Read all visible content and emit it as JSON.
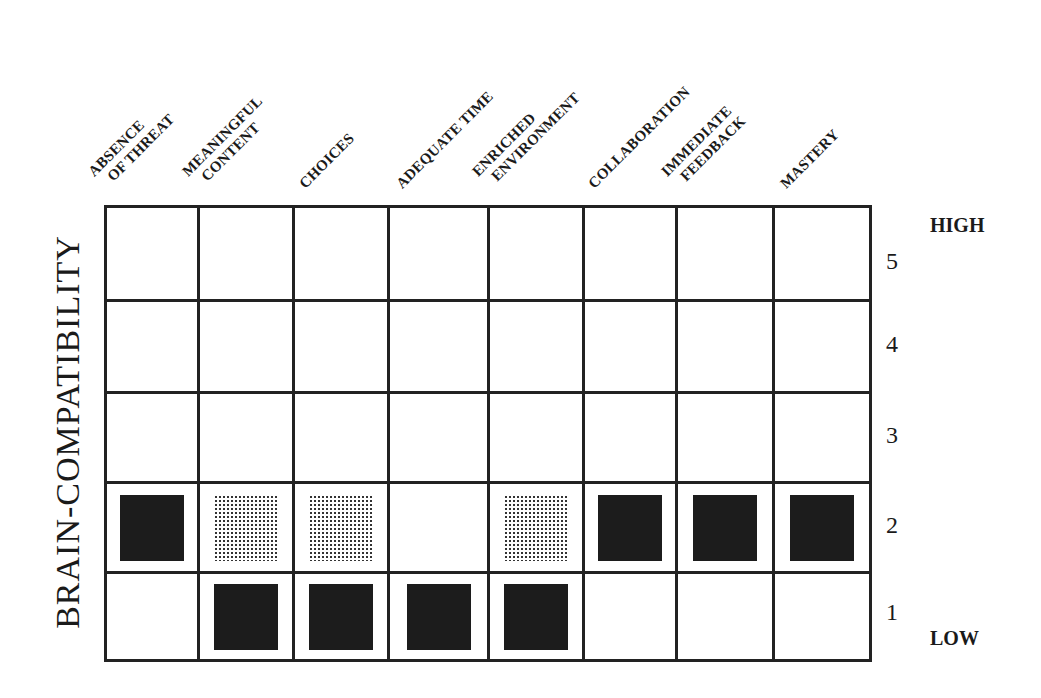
{
  "chart_data": {
    "type": "heatmap",
    "title": "",
    "ylabel": "BRAIN-COMPATIBILITY",
    "xlabel": "",
    "categories": [
      "ABSENCE OF THREAT",
      "MEANINGFUL CONTENT",
      "CHOICES",
      "ADEQUATE TIME",
      "ENRICHED ENVIRONMENT",
      "COLLABORATION",
      "IMMEDIATE FEEDBACK",
      "MASTERY"
    ],
    "category_label_lines": [
      [
        "ABSENCE",
        "OF THREAT"
      ],
      [
        "MEANINGFUL",
        "CONTENT"
      ],
      [
        "CHOICES"
      ],
      [
        "ADEQUATE TIME"
      ],
      [
        "ENRICHED",
        "ENVIRONMENT"
      ],
      [
        "COLLABORATION"
      ],
      [
        "IMMEDIATE",
        "FEEDBACK"
      ],
      [
        "MASTERY"
      ]
    ],
    "y_ticks": [
      "5",
      "4",
      "3",
      "2",
      "1"
    ],
    "y_high_label": "HIGH",
    "y_low_label": "LOW",
    "ylim": [
      1,
      5
    ],
    "legend": {
      "solid": "solid black square",
      "dotted": "dotted/stippled square"
    },
    "series": [
      {
        "name": "solid",
        "values": [
          2,
          1,
          1,
          1,
          1,
          2,
          2,
          2
        ]
      },
      {
        "name": "dotted",
        "values": [
          null,
          2,
          2,
          null,
          2,
          null,
          null,
          null
        ]
      }
    ],
    "marks": [
      {
        "category": "ABSENCE OF THREAT",
        "level": 2,
        "style": "solid"
      },
      {
        "category": "MEANINGFUL CONTENT",
        "level": 2,
        "style": "dotted"
      },
      {
        "category": "MEANINGFUL CONTENT",
        "level": 1,
        "style": "solid"
      },
      {
        "category": "CHOICES",
        "level": 2,
        "style": "dotted"
      },
      {
        "category": "CHOICES",
        "level": 1,
        "style": "solid"
      },
      {
        "category": "ADEQUATE TIME",
        "level": 1,
        "style": "solid"
      },
      {
        "category": "ENRICHED ENVIRONMENT",
        "level": 2,
        "style": "dotted"
      },
      {
        "category": "ENRICHED ENVIRONMENT",
        "level": 1,
        "style": "solid"
      },
      {
        "category": "COLLABORATION",
        "level": 2,
        "style": "solid"
      },
      {
        "category": "IMMEDIATE FEEDBACK",
        "level": 2,
        "style": "solid"
      },
      {
        "category": "MASTERY",
        "level": 2,
        "style": "solid"
      }
    ],
    "grid": true
  },
  "colors": {
    "line": "#222222",
    "solid": "#1c1c1c",
    "dotted": "#333333",
    "background": "#ffffff"
  }
}
